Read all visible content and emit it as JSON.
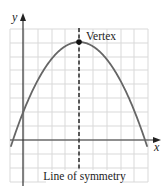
{
  "figure": {
    "axes": {
      "x_label": "x",
      "y_label": "y"
    },
    "annotations": {
      "vertex_label": "Vertex",
      "symmetry_label": "Line of symmetry"
    },
    "colors": {
      "grid": "#d9d9d9",
      "axis": "#333333",
      "curve": "#666666",
      "symmetry_line": "#333333",
      "vertex_point": "#111111"
    },
    "grid": {
      "x_lines": [
        10,
        24,
        38,
        52,
        65,
        79,
        93,
        107,
        121,
        134,
        148
      ],
      "y_lines": [
        29,
        43,
        57,
        70,
        84,
        98,
        112,
        126,
        140,
        154,
        168,
        182
      ]
    },
    "curve": {
      "type": "downward parabola",
      "vertex": [
        79,
        42
      ],
      "x_intercepts_px": [
        14,
        146
      ]
    }
  }
}
